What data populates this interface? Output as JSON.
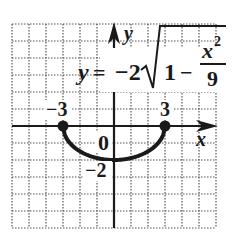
{
  "chart_data": {
    "type": "line",
    "title": "",
    "equation": {
      "lhs": "y",
      "equals": "=",
      "coef": "−2",
      "radicand_one": "1",
      "minus": "−",
      "numerator": "x",
      "exponent": "2",
      "denominator": "9"
    },
    "xlabel": "x",
    "ylabel": "y",
    "xlim": [
      -6,
      6
    ],
    "ylim": [
      -6,
      6
    ],
    "grid": true,
    "tick_labels": {
      "x_neg": "−3",
      "x_pos": "3",
      "origin": "0",
      "y_neg": "−2"
    },
    "series": [
      {
        "name": "y = -2 sqrt(1 - x^2/9)",
        "x": [
          -3,
          -2.5,
          -2,
          -1.5,
          -1,
          -0.5,
          0,
          0.5,
          1,
          1.5,
          2,
          2.5,
          3
        ],
        "y": [
          0,
          -1.106,
          -1.491,
          -1.732,
          -1.886,
          -1.972,
          -2,
          -1.972,
          -1.886,
          -1.732,
          -1.491,
          -1.106,
          0
        ]
      }
    ],
    "endpoints": [
      [
        -3,
        0
      ],
      [
        3,
        0
      ]
    ]
  },
  "colors": {
    "ink": "#1a1a1a",
    "grid": "#555555",
    "background": "#ffffff"
  }
}
